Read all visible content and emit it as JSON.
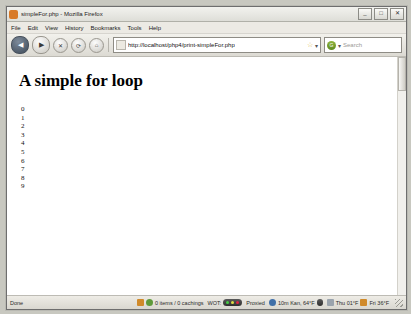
{
  "window": {
    "title": "simpleFor.php - Mozilla Firefox",
    "buttons": {
      "minimize": "_",
      "maximize": "□",
      "close": "✕"
    }
  },
  "menu": {
    "items": [
      "File",
      "Edit",
      "View",
      "History",
      "Bookmarks",
      "Tools",
      "Help"
    ]
  },
  "toolbar": {
    "back": "◀",
    "forward": "▶",
    "stop": "✕",
    "reload": "⟳",
    "home": "⌂",
    "url": "http://localhost/php4/print-simpleFor.php",
    "star": "☆",
    "dropdown": "▾",
    "search_placeholder": "Search",
    "search_engine_icon": "G"
  },
  "page": {
    "heading": "A simple for loop",
    "numbers": [
      "0",
      "1",
      "2",
      "3",
      "4",
      "5",
      "6",
      "7",
      "8",
      "9"
    ]
  },
  "status": {
    "left": "Done",
    "transfer": "0 items / 0 cachings",
    "wot_label": "WOT:",
    "proxy": "Proxied",
    "network": "10m Kan, 64°F",
    "clock": "Thu 01°F",
    "extra": "Fri 36°F"
  },
  "colors": {
    "accent": "#d87a28",
    "chrome": "#e8e8e4",
    "page_bg": "#ffffff",
    "text": "#111111"
  }
}
